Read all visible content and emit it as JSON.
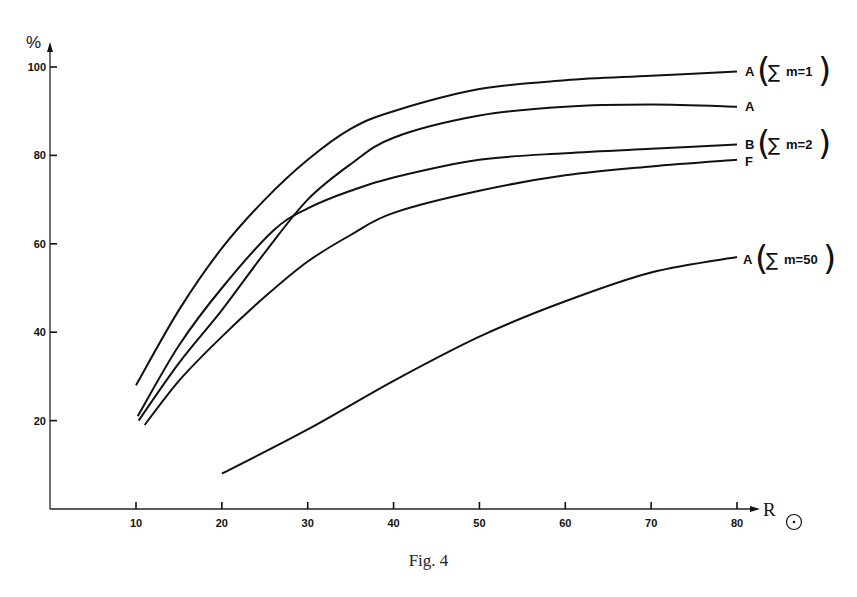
{
  "figure": {
    "caption": "Fig. 4"
  },
  "axes": {
    "y_label": "%",
    "x_label": "R",
    "x_label_symbol": "⊙",
    "y_ticks": [
      "20",
      "40",
      "60",
      "80",
      "100"
    ],
    "x_ticks": [
      "10",
      "20",
      "30",
      "40",
      "50",
      "60",
      "70",
      "80"
    ]
  },
  "curve_labels": [
    {
      "letter": "A",
      "sum_text": "m=1"
    },
    {
      "letter": "A",
      "sum_text": ""
    },
    {
      "letter": "B",
      "sum_text": "m=2"
    },
    {
      "letter": "F",
      "sum_text": ""
    },
    {
      "letter": "A",
      "sum_text": "m=50"
    }
  ],
  "chart_data": {
    "type": "line",
    "title": "",
    "caption": "Fig. 4",
    "xlabel": "R⊙",
    "ylabel": "%",
    "xlim": [
      0,
      85
    ],
    "ylim": [
      0,
      105
    ],
    "x_ticks": [
      10,
      20,
      30,
      40,
      50,
      60,
      70,
      80
    ],
    "y_ticks": [
      20,
      40,
      60,
      80,
      100
    ],
    "grid": false,
    "legend": "inline labels at right end of curves",
    "series": [
      {
        "name": "A (Σm=1)",
        "x": [
          10,
          15,
          20,
          25,
          30,
          35,
          40,
          50,
          60,
          70,
          80
        ],
        "values": [
          28,
          45,
          59,
          70,
          79,
          86,
          90,
          95,
          97,
          98,
          99
        ]
      },
      {
        "name": "A",
        "x": [
          10.3,
          15,
          20,
          25,
          30,
          35,
          40,
          50,
          60,
          70,
          80
        ],
        "values": [
          20,
          33,
          45,
          58,
          70,
          78,
          84,
          89,
          91,
          91.5,
          91
        ]
      },
      {
        "name": "B (Σm=2)",
        "x": [
          10.2,
          15,
          20,
          26,
          30,
          35,
          40,
          50,
          60,
          70,
          80
        ],
        "values": [
          21,
          37,
          50,
          63,
          68,
          72,
          75,
          79,
          80.5,
          81.5,
          82.5
        ]
      },
      {
        "name": "F",
        "x": [
          11,
          15,
          20,
          25,
          30,
          35,
          40,
          50,
          60,
          70,
          80
        ],
        "values": [
          19,
          29,
          39,
          48,
          56,
          62,
          67,
          72,
          75.5,
          77.5,
          79
        ]
      },
      {
        "name": "A (Σm=50)",
        "x": [
          20,
          30,
          40,
          50,
          60,
          70,
          80
        ],
        "values": [
          8,
          18,
          29,
          39,
          47,
          53.5,
          57
        ]
      }
    ]
  }
}
